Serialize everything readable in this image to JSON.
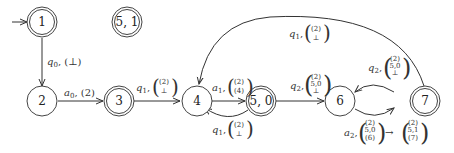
{
  "diagram": {
    "type": "state-machine",
    "nodes": [
      {
        "id": "1",
        "label": "1",
        "accepting": true,
        "initial": true
      },
      {
        "id": "51",
        "label": "5, 1",
        "accepting": true
      },
      {
        "id": "2",
        "label": "2",
        "accepting": false
      },
      {
        "id": "3",
        "label": "3",
        "accepting": true
      },
      {
        "id": "4",
        "label": "4",
        "accepting": false
      },
      {
        "id": "50",
        "label": "5, 0",
        "accepting": true
      },
      {
        "id": "6",
        "label": "6",
        "accepting": false
      },
      {
        "id": "7",
        "label": "7",
        "accepting": true
      }
    ],
    "edges": [
      {
        "from": "1",
        "to": "2",
        "sym": "q",
        "sub": "0",
        "stack": [
          "⊥"
        ]
      },
      {
        "from": "2",
        "to": "3",
        "sym": "a",
        "sub": "0",
        "stack": [
          "2"
        ]
      },
      {
        "from": "3",
        "to": "4",
        "sym": "q",
        "sub": "1",
        "stack": [
          "(2)",
          "⊥"
        ]
      },
      {
        "from": "4",
        "to": "50",
        "sym": "a",
        "sub": "1",
        "stack": [
          "(2)",
          "(4)"
        ]
      },
      {
        "from": "50",
        "to": "4",
        "sym": "q",
        "sub": "1",
        "stack": [
          "(2)",
          "⊥"
        ]
      },
      {
        "from": "50",
        "to": "6",
        "sym": "q",
        "sub": "2",
        "stack": [
          "(2)",
          "5,0",
          "⊥"
        ]
      },
      {
        "from": "7",
        "to": "6",
        "sym": "q",
        "sub": "2",
        "stack": [
          "(2)",
          "5,0",
          "⊥"
        ]
      },
      {
        "from": "6",
        "to": "7",
        "sym": "a",
        "sub": "2",
        "stack": [
          "(2)",
          "5,0",
          "(6)"
        ],
        "result": [
          "(2)",
          "5,1",
          "(7)"
        ]
      },
      {
        "from": "7",
        "to": "4",
        "sym": "q",
        "sub": "1",
        "stack": [
          "(2)",
          "⊥"
        ]
      }
    ]
  },
  "labels": {
    "n1": "1",
    "n51": "5, 1",
    "n2": "2",
    "n3": "3",
    "n4": "4",
    "n50": "5, 0",
    "n6": "6",
    "n7": "7",
    "e12_sym": "q",
    "e12_sub": "0",
    "e12_val": "(⊥)",
    "e23_sym": "a",
    "e23_sub": "0",
    "e23_val": "(2)",
    "e34_sym": "q",
    "e34_sub": "1",
    "e34_top": "(2)",
    "e34_bot": "⊥",
    "e450_sym": "a",
    "e450_sub": "1",
    "e450_top": "(2)",
    "e450_bot": "(4)",
    "e504_sym": "q",
    "e504_sub": "1",
    "e504_top": "(2)",
    "e504_bot": "⊥",
    "e506_sym": "q",
    "e506_sub": "2",
    "e506_r1": "(2)",
    "e506_r2": "5,0",
    "e506_r3": "⊥",
    "e76_sym": "q",
    "e76_sub": "2",
    "e76_r1": "(2)",
    "e76_r2": "5,0",
    "e76_r3": "⊥",
    "e67_sym": "a",
    "e67_sub": "2",
    "e67_r1": "(2)",
    "e67_r2": "5,0",
    "e67_r3": "(6)",
    "arrow": "→",
    "e67_s1": "(2)",
    "e67_s2": "5,1",
    "e67_s3": "(7)",
    "e74_sym": "q",
    "e74_sub": "1",
    "e74_top": "(2)",
    "e74_bot": "⊥"
  }
}
